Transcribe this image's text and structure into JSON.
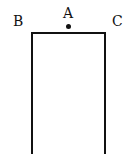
{
  "diagram": {
    "type": "open-rectangle",
    "labels": {
      "a": "A",
      "b": "B",
      "c": "C"
    },
    "points": [
      {
        "name": "A",
        "position": "top-center",
        "marked_with_dot": true
      },
      {
        "name": "B",
        "position": "top-left-corner"
      },
      {
        "name": "C",
        "position": "top-right-corner"
      }
    ],
    "stroke_color": "#111111",
    "background_color": "#ffffff"
  }
}
